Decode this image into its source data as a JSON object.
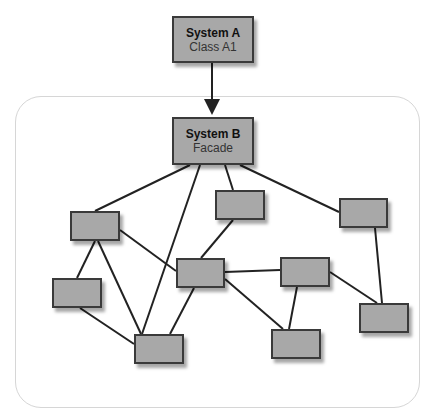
{
  "diagram": {
    "type": "facade-pattern",
    "nodes": [
      {
        "id": "system-a",
        "title": "System A",
        "subtitle": "Class A1",
        "x": 172,
        "y": 16,
        "w": 82,
        "h": 47
      },
      {
        "id": "system-b",
        "title": "System B",
        "subtitle": "Facade",
        "x": 172,
        "y": 117,
        "w": 82,
        "h": 48
      },
      {
        "id": "n1",
        "x": 70,
        "y": 211,
        "w": 50,
        "h": 30
      },
      {
        "id": "n2",
        "x": 215,
        "y": 190,
        "w": 50,
        "h": 30
      },
      {
        "id": "n3",
        "x": 339,
        "y": 198,
        "w": 49,
        "h": 30
      },
      {
        "id": "n4",
        "x": 52,
        "y": 278,
        "w": 50,
        "h": 30
      },
      {
        "id": "n5",
        "x": 176,
        "y": 258,
        "w": 49,
        "h": 30
      },
      {
        "id": "n6",
        "x": 280,
        "y": 257,
        "w": 50,
        "h": 30
      },
      {
        "id": "n7",
        "x": 359,
        "y": 303,
        "w": 50,
        "h": 30
      },
      {
        "id": "n8",
        "x": 134,
        "y": 334,
        "w": 50,
        "h": 30
      },
      {
        "id": "n9",
        "x": 271,
        "y": 329,
        "w": 50,
        "h": 30
      }
    ],
    "arrow": {
      "from": "system-a",
      "to": "system-b",
      "x1": 212,
      "y1": 63,
      "x2": 212,
      "y2": 115
    },
    "edges": [
      [
        190,
        165,
        95,
        211
      ],
      [
        200,
        165,
        142,
        334
      ],
      [
        225,
        165,
        233,
        190
      ],
      [
        240,
        165,
        339,
        212
      ],
      [
        120,
        230,
        176,
        271
      ],
      [
        95,
        241,
        77,
        278
      ],
      [
        98,
        241,
        141,
        334
      ],
      [
        80,
        308,
        134,
        344
      ],
      [
        194,
        288,
        170,
        334
      ],
      [
        233,
        220,
        201,
        258
      ],
      [
        225,
        272,
        280,
        270
      ],
      [
        225,
        279,
        283,
        329
      ],
      [
        297,
        287,
        289,
        329
      ],
      [
        330,
        272,
        377,
        303
      ],
      [
        375,
        228,
        382,
        303
      ]
    ],
    "colors": {
      "node_fill": "#a8a8a8",
      "node_border": "#3a3a3a",
      "line": "#222222",
      "container_border": "#d6d6d6"
    }
  }
}
